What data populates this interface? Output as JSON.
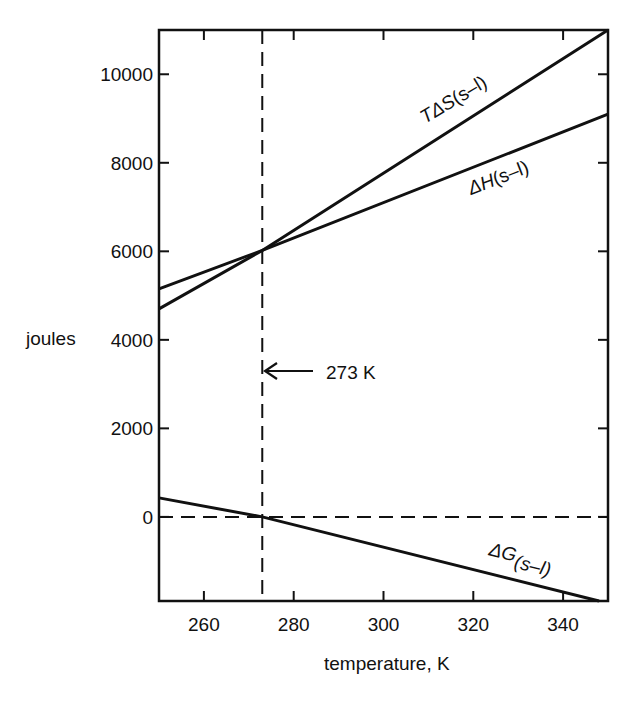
{
  "chart_data": {
    "type": "line",
    "title": "",
    "xlabel": "temperature, K",
    "ylabel": "joules",
    "xlim": [
      250,
      350
    ],
    "ylim": [
      -1900,
      11000
    ],
    "xticks": [
      260,
      280,
      300,
      320,
      340
    ],
    "yticks": [
      0,
      2000,
      4000,
      6000,
      8000,
      10000
    ],
    "xtick_labels": [
      "260",
      "280",
      "300",
      "320",
      "340"
    ],
    "ytick_labels": [
      "0",
      "2000",
      "4000",
      "6000",
      "8000",
      "10000"
    ],
    "grid": false,
    "legend": "none (inline labels)",
    "series": [
      {
        "name": "TΔS(s–l)",
        "x": [
          250,
          273,
          350
        ],
        "values": [
          4700,
          6020,
          11000
        ]
      },
      {
        "name": "ΔH(s–l)",
        "x": [
          250,
          273,
          350
        ],
        "values": [
          5150,
          6020,
          9100
        ]
      },
      {
        "name": "ΔG(s–l)",
        "x": [
          250,
          273,
          348
        ],
        "values": [
          430,
          0,
          -1900
        ]
      }
    ],
    "reference_lines": [
      {
        "orientation": "vertical",
        "x": 273,
        "style": "dashed"
      },
      {
        "orientation": "horizontal",
        "y": 0,
        "style": "dashed"
      }
    ],
    "annotations": [
      {
        "text": "273 K",
        "arrow_to_x": 273,
        "y": 3300
      }
    ]
  },
  "labels": {
    "ylabel": "joules",
    "xlabel": "temperature, K",
    "annotation": "273 K",
    "tds_main": "TΔS",
    "tds_sub": "(s–l)",
    "dh_main": "ΔH",
    "dh_sub": "(s–l)",
    "dg_main": "ΔG",
    "dg_sub": "(s–l)"
  }
}
